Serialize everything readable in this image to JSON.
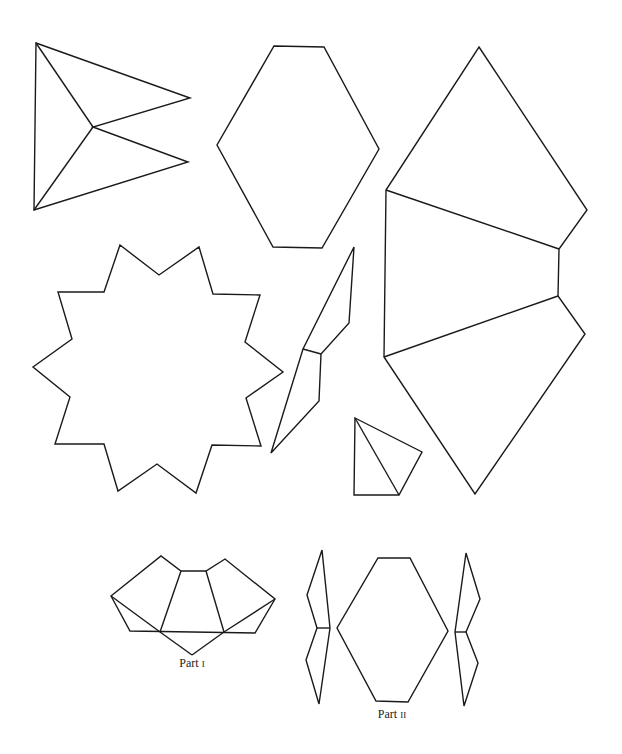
{
  "figure": {
    "stroke_color": "#1a1a1a",
    "background": "#ffffff"
  },
  "shapes": [
    {
      "name": "triangular-net",
      "polygon": "36,43 190,98 93,127 188,162 34,210",
      "lines": [
        "36,43 93,127",
        "93,127 34,210"
      ]
    },
    {
      "name": "hexagon",
      "polygon": "274,46 324,47 379,149 322,248 273,247 217,145",
      "lines": []
    },
    {
      "name": "large-pentagon-net",
      "polygon": "479,47 587,210 559,249 558,296 585,334 475,494 384,357 386,190",
      "lines": [
        "386,190 559,249",
        "384,357 558,296"
      ]
    },
    {
      "name": "ten-point-star",
      "polygon": "120,245 159,275 199,247 213,294 260,295 245,342 283,372 246,398 261,446 212,445 196,493 157,464 118,491 104,444 55,444 70,397 33,367 72,339 58,292 104,292",
      "lines": []
    },
    {
      "name": "narrow-kite-pair",
      "polygon": "354,247 349,323 321,354 319,401 271,453 303,349",
      "lines": [
        "303,349 321,354"
      ]
    },
    {
      "name": "small-kite",
      "polygon": "355,418 422,452 399,495 354,495",
      "lines": [
        "355,418 399,495"
      ]
    }
  ],
  "parts": [
    {
      "label_main": "Part ",
      "label_numeral": "I",
      "label_x": 192,
      "label_y": 667,
      "shapes": [
        {
          "name": "part1-net",
          "polygon": "111,596 161,556 181,571 206,571 225,559 275,599 255,633 130,631",
          "lines": [
            "111,596 160,632",
            "160,632 181,571",
            "206,571 224,632",
            "224,632 275,599",
            "160,632 192,655",
            "192,655 224,632"
          ]
        }
      ]
    },
    {
      "label_main": "Part ",
      "label_numeral": "II",
      "label_x": 392,
      "label_y": 718,
      "shapes": [
        {
          "name": "part2-left-piece",
          "polygon": "322,550 330,628 319,704 306,660 317,628 307,595",
          "lines": [
            "317,628 330,628"
          ]
        },
        {
          "name": "part2-hexagon",
          "polygon": "378,558 410,558 448,631 408,702 376,701 337,628",
          "lines": []
        },
        {
          "name": "part2-right-piece",
          "polygon": "466,553 480,599 466,632 478,663 464,706 455,632",
          "lines": [
            "455,632 466,632"
          ]
        }
      ]
    }
  ]
}
